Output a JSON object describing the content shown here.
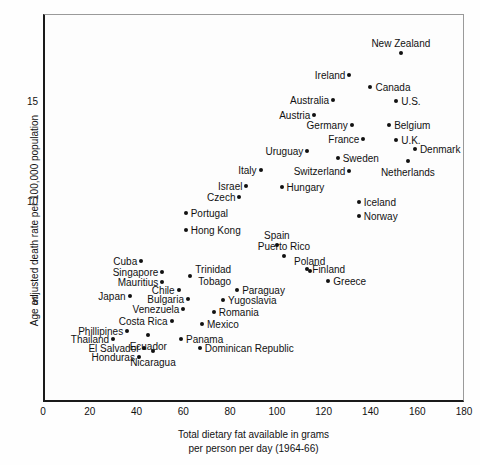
{
  "chart_data": {
    "type": "scatter",
    "title": "Cancer of the Intestine (Except Rectum)",
    "subtitle": "Male",
    "xlabel_line1": "Total dietary fat available in grams",
    "xlabel_line2": "per person per day (1964-66)",
    "ylabel": "Age adjusted death rate per 100,000 population",
    "xlim": [
      0,
      180
    ],
    "ylim": [
      0,
      19.4
    ],
    "xticks": [
      0,
      20,
      40,
      60,
      80,
      100,
      120,
      140,
      160,
      180
    ],
    "yticks": [
      5,
      10,
      15
    ],
    "grid": false,
    "legend": "none",
    "point_color": "#111111",
    "points": [
      {
        "name": "New Zealand",
        "x": 153,
        "y": 17.45,
        "lblpos": "above"
      },
      {
        "name": "Ireland",
        "x": 131,
        "y": 16.35,
        "lblpos": "left"
      },
      {
        "name": "Canada",
        "x": 140,
        "y": 15.75,
        "lblpos": "right"
      },
      {
        "name": "Australia",
        "x": 124,
        "y": 15.1,
        "lblpos": "left"
      },
      {
        "name": "U.S.",
        "x": 151,
        "y": 15.05,
        "lblpos": "right"
      },
      {
        "name": "Austria",
        "x": 116,
        "y": 14.35,
        "lblpos": "left"
      },
      {
        "name": "Germany",
        "x": 132,
        "y": 13.85,
        "lblpos": "left"
      },
      {
        "name": "Belgium",
        "x": 148,
        "y": 13.85,
        "lblpos": "right"
      },
      {
        "name": "France",
        "x": 137,
        "y": 13.15,
        "lblpos": "left"
      },
      {
        "name": "U.K.",
        "x": 151,
        "y": 13.1,
        "lblpos": "right"
      },
      {
        "name": "Denmark",
        "x": 159,
        "y": 12.65,
        "lblpos": "right"
      },
      {
        "name": "Uruguay",
        "x": 113,
        "y": 12.55,
        "lblpos": "left"
      },
      {
        "name": "Sweden",
        "x": 126,
        "y": 12.2,
        "lblpos": "right"
      },
      {
        "name": "Netherlands",
        "x": 156,
        "y": 12.05,
        "lblpos": "below"
      },
      {
        "name": "Italy",
        "x": 93,
        "y": 11.6,
        "lblpos": "left"
      },
      {
        "name": "Switzerland",
        "x": 131,
        "y": 11.55,
        "lblpos": "left"
      },
      {
        "name": "Israel",
        "x": 87,
        "y": 10.8,
        "lblpos": "left"
      },
      {
        "name": "Hungary",
        "x": 102,
        "y": 10.75,
        "lblpos": "right"
      },
      {
        "name": "Czech",
        "x": 84,
        "y": 10.25,
        "lblpos": "left"
      },
      {
        "name": "Iceland",
        "x": 135,
        "y": 10.0,
        "lblpos": "right"
      },
      {
        "name": "Norway",
        "x": 135,
        "y": 9.3,
        "lblpos": "right"
      },
      {
        "name": "Portugal",
        "x": 61,
        "y": 9.45,
        "lblpos": "right"
      },
      {
        "name": "Hong Kong",
        "x": 61,
        "y": 8.6,
        "lblpos": "right"
      },
      {
        "name": "Spain",
        "x": 100,
        "y": 7.85,
        "lblpos": "above"
      },
      {
        "name": "Cuba",
        "x": 42,
        "y": 7.05,
        "lblpos": "left"
      },
      {
        "name": "Puerto Rico",
        "x": 103,
        "y": 7.3,
        "lblpos": "above"
      },
      {
        "name": "Finland",
        "x": 113,
        "y": 6.65,
        "lblpos": "right"
      },
      {
        "name": "Singapore",
        "x": 51,
        "y": 6.5,
        "lblpos": "left"
      },
      {
        "name": "Poland",
        "x": 114,
        "y": 6.55,
        "lblpos": "above"
      },
      {
        "name": "Trinidad Tobago",
        "x": 63,
        "y": 6.3,
        "lblpos": "right2"
      },
      {
        "name": "Mauritius",
        "x": 51,
        "y": 6.0,
        "lblpos": "left"
      },
      {
        "name": "Greece",
        "x": 122,
        "y": 6.05,
        "lblpos": "right"
      },
      {
        "name": "Chile",
        "x": 58,
        "y": 5.6,
        "lblpos": "left"
      },
      {
        "name": "Paraguay",
        "x": 83,
        "y": 5.6,
        "lblpos": "right"
      },
      {
        "name": "Japan",
        "x": 37,
        "y": 5.3,
        "lblpos": "left"
      },
      {
        "name": "Bulgaria",
        "x": 62,
        "y": 5.15,
        "lblpos": "left"
      },
      {
        "name": "Yugoslavia",
        "x": 77,
        "y": 5.1,
        "lblpos": "right"
      },
      {
        "name": "Venezuela",
        "x": 60,
        "y": 4.65,
        "lblpos": "left"
      },
      {
        "name": "Romania",
        "x": 73,
        "y": 4.5,
        "lblpos": "right"
      },
      {
        "name": "Costa Rica",
        "x": 55,
        "y": 4.05,
        "lblpos": "left"
      },
      {
        "name": "Mexico",
        "x": 68,
        "y": 3.9,
        "lblpos": "right"
      },
      {
        "name": "Phillipines",
        "x": 36,
        "y": 3.55,
        "lblpos": "left"
      },
      {
        "name": "Thailand",
        "x": 30,
        "y": 3.15,
        "lblpos": "left"
      },
      {
        "name": "Ecuador",
        "x": 45,
        "y": 3.35,
        "lblpos": "below"
      },
      {
        "name": "Panama",
        "x": 59,
        "y": 3.15,
        "lblpos": "right"
      },
      {
        "name": "El Salvador",
        "x": 43,
        "y": 2.7,
        "lblpos": "left"
      },
      {
        "name": "Dominican Republic",
        "x": 67,
        "y": 2.7,
        "lblpos": "right"
      },
      {
        "name": "Honduras",
        "x": 41,
        "y": 2.25,
        "lblpos": "left"
      },
      {
        "name": "Nicaragua",
        "x": 47,
        "y": 2.55,
        "lblpos": "below"
      }
    ]
  }
}
